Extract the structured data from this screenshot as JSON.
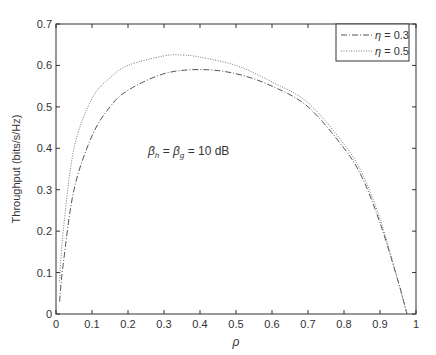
{
  "chart_data": {
    "type": "line",
    "title": "",
    "xlabel": "ρ",
    "ylabel": "Throughput (bits/s/Hz)",
    "xlim": [
      0,
      1
    ],
    "ylim": [
      0,
      0.7
    ],
    "x_ticks": [
      "0",
      "0.1",
      "0.2",
      "0.3",
      "0.4",
      "0.5",
      "0.6",
      "0.7",
      "0.8",
      "0.9",
      "1"
    ],
    "y_ticks": [
      "0",
      "0.1",
      "0.2",
      "0.3",
      "0.4",
      "0.5",
      "0.6",
      "0.7"
    ],
    "grid": false,
    "legend_position": "upper right",
    "annotation": "β_h = β_g = 10 dB",
    "series": [
      {
        "name": "η = 0.3",
        "line_style": "dash-dot",
        "color": "#555555",
        "x": [
          0.01,
          0.02,
          0.05,
          0.1,
          0.15,
          0.2,
          0.3,
          0.4,
          0.5,
          0.6,
          0.7,
          0.8,
          0.85,
          0.9,
          0.95,
          0.975
        ],
        "values": [
          0.03,
          0.12,
          0.3,
          0.43,
          0.5,
          0.54,
          0.58,
          0.59,
          0.58,
          0.55,
          0.5,
          0.4,
          0.33,
          0.22,
          0.08,
          0.0
        ]
      },
      {
        "name": "η = 0.5",
        "line_style": "dotted",
        "color": "#777777",
        "x": [
          0.01,
          0.02,
          0.05,
          0.1,
          0.15,
          0.2,
          0.3,
          0.35,
          0.4,
          0.5,
          0.6,
          0.7,
          0.8,
          0.85,
          0.9,
          0.95,
          0.975
        ],
        "values": [
          0.08,
          0.2,
          0.4,
          0.52,
          0.57,
          0.6,
          0.623,
          0.625,
          0.62,
          0.6,
          0.56,
          0.51,
          0.41,
          0.34,
          0.23,
          0.08,
          0.0
        ]
      }
    ]
  },
  "labels": {
    "xlabel": "ρ",
    "ylabel": "Throughput (bits/s/Hz)",
    "annotation_beta_h": "β",
    "annotation_sub_h": "h",
    "annotation_eq1": " = ",
    "annotation_beta_g": "β",
    "annotation_sub_g": "g",
    "annotation_eq2": " = 10 dB",
    "legend": [
      {
        "symbol": "η",
        "text": " = 0.3"
      },
      {
        "symbol": "η",
        "text": " = 0.5"
      }
    ]
  }
}
